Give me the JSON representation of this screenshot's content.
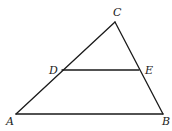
{
  "diagram": {
    "type": "geometry-triangle",
    "points": {
      "A": {
        "label": "A",
        "x": 16,
        "y": 114
      },
      "B": {
        "label": "B",
        "x": 163,
        "y": 114
      },
      "C": {
        "label": "C",
        "x": 115,
        "y": 22
      },
      "D": {
        "label": "D",
        "x": 62,
        "y": 70
      },
      "E": {
        "label": "E",
        "x": 139,
        "y": 70
      }
    },
    "segments": [
      {
        "from": "A",
        "to": "B"
      },
      {
        "from": "B",
        "to": "C"
      },
      {
        "from": "C",
        "to": "A"
      },
      {
        "from": "D",
        "to": "E"
      }
    ],
    "labels": {
      "A": "A",
      "B": "B",
      "C": "C",
      "D": "D",
      "E": "E"
    },
    "colors": {
      "line": "#1a1a1a",
      "background": "#ffffff"
    }
  }
}
